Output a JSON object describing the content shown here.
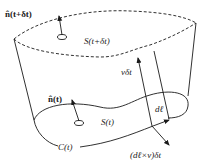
{
  "diagram": {
    "type": "surface-sweep-illustration",
    "labels": {
      "normal_top": "n̂(t+δt)",
      "surface_top": "S(t+δt)",
      "normal_bottom": "n̂(t)",
      "surface_bottom": "S(t)",
      "curve": "C(t)",
      "velocity_displacement": "vδt",
      "line_element": "dℓ",
      "area_element": "(dℓ×v)δt"
    },
    "elements": [
      {
        "name": "top-surface-boundary",
        "style": "dashed",
        "represents": "S(t+δt)"
      },
      {
        "name": "bottom-surface-boundary",
        "style": "solid",
        "represents": "C(t)"
      },
      {
        "name": "normal-vector-top",
        "label_ref": "normal_top"
      },
      {
        "name": "normal-vector-bottom",
        "label_ref": "normal_bottom"
      },
      {
        "name": "displacement-arrow",
        "label_ref": "velocity_displacement"
      },
      {
        "name": "line-element-arrow",
        "label_ref": "line_element"
      },
      {
        "name": "cross-product-arrow",
        "label_ref": "area_element"
      }
    ],
    "colors": {
      "stroke": "#1a1a1a",
      "background": "#ffffff"
    }
  }
}
